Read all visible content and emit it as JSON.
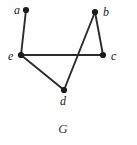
{
  "figure": {
    "caption": "G",
    "caption_pos": {
      "x": 63,
      "y": 133
    },
    "width": 137,
    "height": 145,
    "background_color": "#fefefe",
    "edge_color": "#2b2b2b",
    "vertex_color": "#1c1c1c",
    "label_color": "#1c1c1c"
  },
  "chart_data": {
    "type": "diagram",
    "diagram_kind": "undirected-graph",
    "title": "G",
    "vertices": [
      {
        "id": "a",
        "label": "a",
        "x": 26,
        "y": 10,
        "label_x": 14,
        "label_y": 14,
        "degree": 1
      },
      {
        "id": "b",
        "label": "b",
        "x": 95,
        "y": 12,
        "label_x": 103,
        "label_y": 16,
        "degree": 2
      },
      {
        "id": "c",
        "label": "c",
        "x": 103,
        "y": 55,
        "label_x": 111,
        "label_y": 60,
        "degree": 2
      },
      {
        "id": "d",
        "label": "d",
        "x": 64,
        "y": 90,
        "label_x": 60,
        "label_y": 105,
        "degree": 2
      },
      {
        "id": "e",
        "label": "e",
        "x": 21,
        "y": 55,
        "label_x": 8,
        "label_y": 60,
        "degree": 3
      }
    ],
    "edges": [
      {
        "from": "a",
        "to": "e"
      },
      {
        "from": "e",
        "to": "c"
      },
      {
        "from": "e",
        "to": "d"
      },
      {
        "from": "d",
        "to": "b"
      },
      {
        "from": "b",
        "to": "c"
      }
    ],
    "vertex_count": 5,
    "edge_count": 5,
    "crossings": [
      {
        "edge_a": "d-b",
        "edge_b": "e-c",
        "x": 82,
        "y": 55
      }
    ]
  }
}
